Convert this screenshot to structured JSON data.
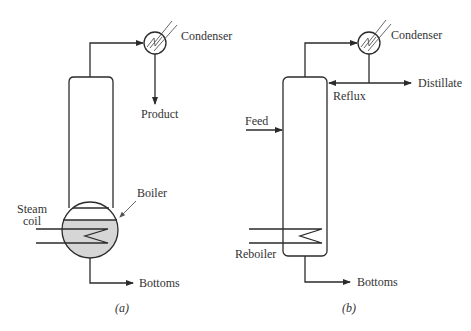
{
  "diagram_a": {
    "caption": "(a)",
    "labels": {
      "condenser": "Condenser",
      "product": "Product",
      "boiler": "Boiler",
      "steam_coil_line1": "Steam",
      "steam_coil_line2": "coil",
      "bottoms": "Bottoms"
    }
  },
  "diagram_b": {
    "caption": "(b)",
    "labels": {
      "condenser": "Condenser",
      "distillate": "Distillate",
      "reflux": "Reflux",
      "feed": "Feed",
      "reboiler": "Reboiler",
      "bottoms": "Bottoms"
    }
  },
  "colors": {
    "line": "#2b2b2b",
    "liquid_fill": "#d6d6d6",
    "text": "#333333"
  }
}
